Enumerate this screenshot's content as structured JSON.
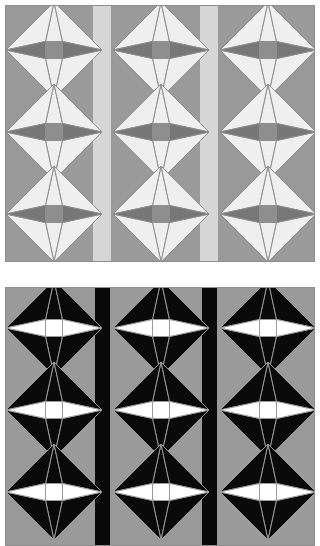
{
  "image": {
    "title": "Quilt block pattern — two panels",
    "width": 320,
    "height": 546,
    "background_color": "#ffffff"
  },
  "palette": {
    "panel_background_gray": "#9a9a9a",
    "wedge_light": "#efefef",
    "wedge_dark_gray": "#777777",
    "center_square_gray": "#8e8e8e",
    "stripe_light_gray": "#d6d6d6",
    "outline_gray": "#8e8e8e",
    "black": "#0a0a0a",
    "white": "#ffffff",
    "border_gray": "#8e8e8e"
  },
  "panels": [
    {
      "id": "panel-top",
      "name": "grayscale-panel",
      "label": "Top panel — low contrast grayscale colorway",
      "x": 5,
      "y": 5,
      "width": 310,
      "height": 257,
      "background": "#9a9a9a",
      "stripe_color": "#d6d6d6",
      "stripe_width": 18,
      "stripe_positions": [
        87,
        194
      ],
      "columns": 3,
      "rows": 3,
      "motif": {
        "style": "muted",
        "diamond_fill": "#9a9a9a",
        "wedge_vertical_fill": "#efefef",
        "wedge_horizontal_fill": "#777777",
        "center_fill": "#8e8e8e",
        "outline": "#8e8e8e",
        "outline_width": 1,
        "size": 96,
        "center_square": 17
      },
      "column_centers": [
        48,
        155,
        262
      ],
      "row_centers": [
        44,
        126,
        208
      ],
      "row_spacing": 82
    },
    {
      "id": "panel-bottom",
      "name": "high-contrast-panel",
      "label": "Bottom panel — high contrast black and white colorway",
      "x": 5,
      "y": 287,
      "width": 310,
      "height": 259,
      "background": "#9a9a9a",
      "stripe_color": "#0a0a0a",
      "stripe_width": 15,
      "stripe_positions": [
        89,
        196
      ],
      "columns": 3,
      "rows": 3,
      "motif": {
        "style": "contrast",
        "diamond_fill": "#0a0a0a",
        "wedge_vertical_fill": "#0a0a0a",
        "wedge_horizontal_fill": "#ffffff",
        "center_fill": "#ffffff",
        "outline": "#9a9a9a",
        "outline_width": 1,
        "size": 96,
        "center_square": 17
      },
      "column_centers": [
        48,
        155,
        262
      ],
      "row_centers": [
        40,
        122,
        204
      ],
      "row_spacing": 82
    }
  ]
}
